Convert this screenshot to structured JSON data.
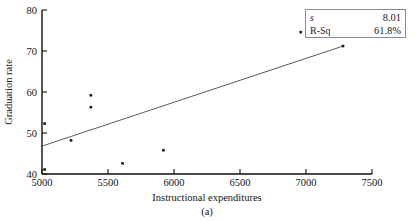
{
  "figure": {
    "caption": "(a)"
  },
  "legend": {
    "rows": [
      {
        "key": "s",
        "value": "8.01",
        "italic": true
      },
      {
        "key": "R-Sq",
        "value": "61.8%",
        "italic": false
      }
    ]
  },
  "chart_data": {
    "type": "scatter",
    "title": "",
    "xlabel": "Instructional expenditures",
    "ylabel": "Graduation rate",
    "xlim": [
      5000,
      7500
    ],
    "ylim": [
      40,
      80
    ],
    "xticks": [
      5000,
      5500,
      6000,
      6500,
      7000,
      7500
    ],
    "yticks": [
      40,
      50,
      60,
      70,
      80
    ],
    "xtick_labels": [
      "5000",
      "5500",
      "6000",
      "6500",
      "7000",
      "7500"
    ],
    "ytick_labels": [
      "40",
      "50",
      "60",
      "70",
      "80"
    ],
    "grid": false,
    "legend_position": "top-right",
    "marker": "square",
    "marker_color": "#1b1b1b",
    "line_color": "#5a5a62",
    "points": [
      {
        "x": 5020,
        "y": 52.3
      },
      {
        "x": 5020,
        "y": 41.1
      },
      {
        "x": 5220,
        "y": 48.2
      },
      {
        "x": 5370,
        "y": 59.2
      },
      {
        "x": 5370,
        "y": 56.3
      },
      {
        "x": 5610,
        "y": 42.6
      },
      {
        "x": 5920,
        "y": 45.8
      },
      {
        "x": 6960,
        "y": 74.6
      },
      {
        "x": 7280,
        "y": 71.2
      }
    ],
    "fit_line": {
      "label": "regression-line",
      "x1": 5000,
      "y1": 46.8,
      "x2": 7290,
      "y2": 71.3,
      "s": 8.01,
      "r_sq": 61.8
    }
  }
}
